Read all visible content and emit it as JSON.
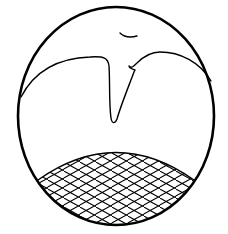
{
  "figure": {
    "colors": {
      "background": "#ffffff",
      "stroke": "#000000"
    },
    "outline": {
      "cx": 116,
      "cy": 116,
      "rx": 98,
      "ry": 109,
      "stroke_width": 2.6
    },
    "hatch_pattern": "diagonal-crosshatch"
  }
}
